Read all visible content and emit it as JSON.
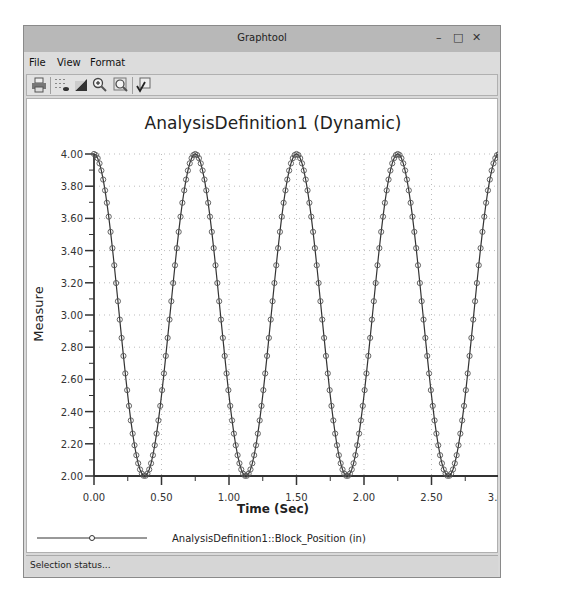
{
  "window": {
    "title": "Graphtool",
    "controls": {
      "minimize": "–",
      "maximize": "□",
      "close": "✕"
    }
  },
  "menu": [
    {
      "label": "File",
      "mnemonic": "F"
    },
    {
      "label": "View",
      "mnemonic": "V"
    },
    {
      "label": "Format",
      "mnemonic": "r"
    }
  ],
  "toolbar": [
    {
      "name": "print-icon"
    },
    {
      "name": "grid-toggle-icon"
    },
    {
      "name": "background-fill-icon"
    },
    {
      "name": "zoom-in-icon"
    },
    {
      "name": "zoom-fit-icon"
    },
    {
      "name": "edit-checkmark-icon"
    }
  ],
  "status": {
    "text": "Selection status..."
  },
  "chart_data": {
    "type": "line",
    "title": "AnalysisDefinition1 (Dynamic)",
    "xlabel": "Time (Sec)",
    "ylabel": "Measure",
    "xlim": [
      0.0,
      3.0
    ],
    "ylim": [
      2.0,
      4.0
    ],
    "x_ticks": [
      "0.00",
      "0.50",
      "1.00",
      "1.50",
      "2.00",
      "2.50",
      "3.00"
    ],
    "y_ticks": [
      "4.00",
      "3.80",
      "3.60",
      "3.40",
      "3.20",
      "3.00",
      "2.80",
      "2.60",
      "2.40",
      "2.20",
      "2.00"
    ],
    "grid": true,
    "legend_position": "bottom",
    "series": [
      {
        "name": "AnalysisDefinition1::Block_Position (in)",
        "marker": "circle",
        "model": "y = 3 + cos(2*pi*t/0.75)",
        "peaks_x": [
          0.0,
          0.75,
          1.5,
          2.25,
          3.0
        ],
        "peaks_y": 4.0,
        "troughs_x": [
          0.375,
          1.125,
          1.875,
          2.625
        ],
        "troughs_y": 2.0,
        "x": [
          0.0,
          0.1875,
          0.375,
          0.5625,
          0.75,
          0.9375,
          1.125,
          1.3125,
          1.5,
          1.6875,
          1.875,
          2.0625,
          2.25,
          2.4375,
          2.625,
          2.8125,
          3.0
        ],
        "values": [
          4.0,
          3.0,
          2.0,
          3.0,
          4.0,
          3.0,
          2.0,
          3.0,
          4.0,
          3.0,
          2.0,
          3.0,
          4.0,
          3.0,
          2.0,
          3.0,
          4.0
        ]
      }
    ]
  }
}
